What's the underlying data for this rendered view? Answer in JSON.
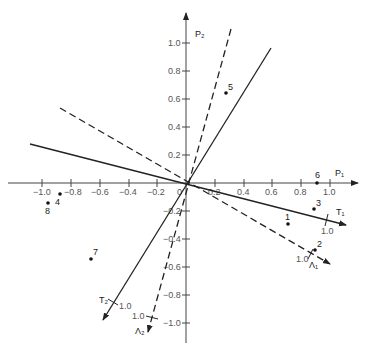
{
  "diagram": {
    "origin_px": [
      183,
      183
    ],
    "scale_px": [
      143,
      140
    ],
    "axes": {
      "p1": {
        "label": "P₁",
        "ticks": [
          -1.0,
          -0.8,
          -0.6,
          -0.4,
          -0.2,
          0,
          0.2,
          0.4,
          0.6,
          0.8,
          1.0
        ]
      },
      "p2": {
        "label": "P₂",
        "ticks": [
          1.0,
          0.8,
          0.6,
          0.4,
          0.2,
          -0.2,
          -0.4,
          -0.6,
          -0.8,
          -1.0
        ]
      }
    },
    "tick_labels_x": [
      "−1.0",
      "−0.8",
      "−0.6",
      "−0.4",
      "−0.2",
      "0",
      "0.2",
      "0.4",
      "0.6",
      "0.8",
      "1.0"
    ],
    "tick_labels_y_pos": [
      "1.0",
      "0.8",
      "0.6",
      "0.4",
      "0.2"
    ],
    "tick_labels_y_neg": [
      "−0.2",
      "−0.4",
      "−0.6",
      "−0.8",
      "−1.0"
    ],
    "vectors": [
      {
        "name": "T1",
        "label": "T₁",
        "style": "solid",
        "unit_label": "1.0"
      },
      {
        "name": "T2",
        "label": "T₂",
        "style": "solid",
        "unit_label": "1.0"
      },
      {
        "name": "L1",
        "label": "Λ₁",
        "style": "dashed",
        "unit_label": "1.0"
      },
      {
        "name": "L2",
        "label": "Λ₂",
        "style": "dashed",
        "unit_label": "1.0"
      }
    ],
    "points": [
      {
        "id": "1",
        "x": 0.68,
        "y": -0.3
      },
      {
        "id": "2",
        "x": 0.88,
        "y": -0.58
      },
      {
        "id": "3",
        "x": 0.87,
        "y": -0.15
      },
      {
        "id": "4",
        "x": -0.88,
        "y": -0.07
      },
      {
        "id": "5",
        "x": 0.27,
        "y": 0.63
      },
      {
        "id": "6",
        "x": 0.89,
        "y": 0.01
      },
      {
        "id": "7",
        "x": -0.66,
        "y": -0.53
      },
      {
        "id": "8",
        "x": -0.96,
        "y": -0.15
      }
    ]
  }
}
